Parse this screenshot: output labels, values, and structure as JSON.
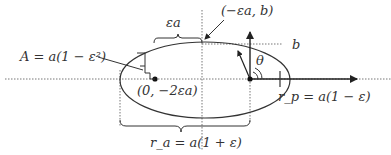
{
  "diagram": {
    "labels": {
      "eps_a": "εa",
      "top_point": "(−εa, b)",
      "b": "b",
      "A_eq": "A = a(1 − ε²)",
      "theta": "θ",
      "center_point": "(0, −2εa)",
      "rp_eq": "r_p = a(1 − ε)",
      "ra_eq": "r_a = a(1 + ε)"
    },
    "colors": {
      "line": "#333333",
      "dotted": "#777777"
    }
  }
}
